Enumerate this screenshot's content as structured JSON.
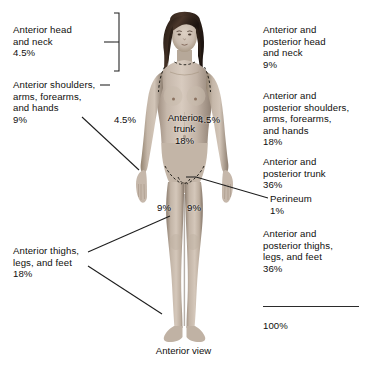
{
  "figure": {
    "caption": "Anterior view",
    "total_label": "100%"
  },
  "left_labels": [
    {
      "id": "anterior-head-neck",
      "text": "Anterior head\nand neck\n4.5%",
      "region": "Anterior head and neck",
      "percent": "4.5%"
    },
    {
      "id": "anterior-shoulders-arms",
      "text": "Anterior shoulders,\narms, forearms,\nand hands\n9%",
      "region": "Anterior shoulders, arms, forearms, and hands",
      "percent": "9%"
    },
    {
      "id": "anterior-thighs-legs-feet",
      "text": "Anterior thighs,\nlegs, and feet\n18%",
      "region": "Anterior thighs, legs, and feet",
      "percent": "18%"
    }
  ],
  "right_labels": [
    {
      "id": "ap-head-neck",
      "text": "Anterior and\nposterior head\nand neck\n9%",
      "region": "Anterior and posterior head and neck",
      "percent": "9%"
    },
    {
      "id": "ap-shoulders-arms",
      "text": "Anterior and\nposterior shoulders,\narms, forearms,\nand hands\n18%",
      "region": "Anterior and posterior shoulders, arms, forearms, and hands",
      "percent": "18%"
    },
    {
      "id": "ap-trunk",
      "text": "Anterior and\nposterior trunk\n36%",
      "region": "Anterior and posterior trunk",
      "percent": "36%"
    },
    {
      "id": "perineum",
      "text": "Perineum\n1%",
      "region": "Perineum",
      "percent": "1%"
    },
    {
      "id": "ap-thighs-legs-feet",
      "text": "Anterior and\nposterior thighs,\nlegs, and feet\n36%",
      "region": "Anterior and posterior thighs, legs, and feet",
      "percent": "36%"
    }
  ],
  "figure_labels": [
    {
      "id": "arm-left-pct",
      "text": "4.5%"
    },
    {
      "id": "arm-right-pct",
      "text": "4.5%"
    },
    {
      "id": "trunk-pct",
      "text": "Anterior\ntrunk\n18%"
    },
    {
      "id": "thigh-left-pct",
      "text": "9%"
    },
    {
      "id": "thigh-right-pct",
      "text": "9%"
    }
  ],
  "colors": {
    "background": "#ffffff",
    "text": "#100f0d",
    "leader_line": "#1d1d1d",
    "skin_light": "#cfc2b6",
    "skin_mid": "#b3a294",
    "skin_shadow": "#8e7f72",
    "hair": "#3a2b22"
  }
}
